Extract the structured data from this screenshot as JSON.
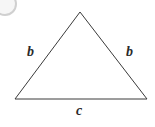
{
  "figure": {
    "kind": "geometry-diagram",
    "shape": "isosceles-triangle",
    "background_color": "#ffffff",
    "stroke_color": "#3a3a3a",
    "stroke_width": 1,
    "label_color": "#2a2a2a",
    "width": 155,
    "height": 127,
    "vertices": {
      "apex": [
        80,
        12
      ],
      "bottom_left": [
        15,
        99
      ],
      "bottom_right": [
        147,
        99
      ]
    },
    "labels": {
      "left_leg": "b",
      "right_leg": "b",
      "base": "c"
    },
    "artifact": {
      "name": "scan-artifact",
      "description": "faint grey circular smudge in top-left corner"
    }
  }
}
